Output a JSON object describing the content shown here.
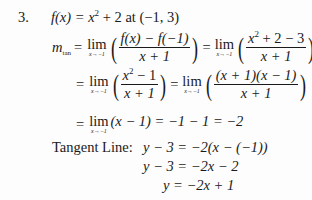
{
  "problem": {
    "number": "3.",
    "statement": {
      "func": "f(x) = x",
      "exp": "2",
      "rest": " + 2  at  (−1, 3)"
    },
    "slope_def": {
      "m": "m",
      "sub": "tan",
      "eq": "=",
      "lim_word": "lim",
      "lim_sub": "x→−1",
      "frac1_num": "f(x) − f(−1)",
      "frac1_den": "x + 1",
      "eq2": "=",
      "frac2_num_a": "x",
      "frac2_num_exp": "2",
      "frac2_num_b": " + 2 − 3",
      "frac2_den": "x + 1"
    },
    "step2": {
      "eq": "=",
      "lim_word": "lim",
      "lim_sub": "x→−1",
      "frac1_num_a": "x",
      "frac1_num_exp": "2",
      "frac1_num_b": " − 1",
      "frac1_den": "x + 1",
      "eq2": "=",
      "frac2_num": "(x + 1)(x − 1)",
      "frac2_den": "x + 1"
    },
    "step3": {
      "eq": "=",
      "lim_word": "lim",
      "lim_sub": "x→−1",
      "expr": "(x − 1) = −1 − 1 = −2"
    },
    "tangent": {
      "label": "Tangent Line:",
      "line1": "y − 3 = −2(x − (−1))",
      "line2": "y − 3 = −2x − 2",
      "line3": "y = −2x + 1"
    }
  }
}
